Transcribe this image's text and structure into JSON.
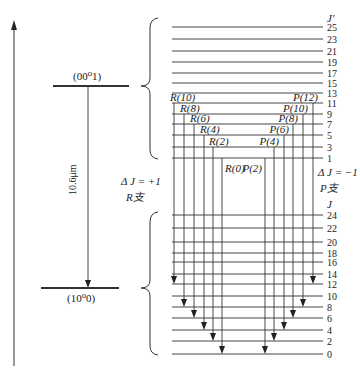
{
  "upper_state": {
    "label": "(00⁰1)",
    "y": 86,
    "header": "J′",
    "levels": [
      {
        "J": "25",
        "y": 27
      },
      {
        "J": "23",
        "y": 39
      },
      {
        "J": "21",
        "y": 51
      },
      {
        "J": "19",
        "y": 62
      },
      {
        "J": "17",
        "y": 73
      },
      {
        "J": "15",
        "y": 83
      },
      {
        "J": "13",
        "y": 93
      },
      {
        "J": "11",
        "y": 103
      },
      {
        "J": "9",
        "y": 114
      },
      {
        "J": "7",
        "y": 124
      },
      {
        "J": "5",
        "y": 135
      },
      {
        "J": "3",
        "y": 147
      },
      {
        "J": "1",
        "y": 158
      }
    ]
  },
  "lower_state": {
    "label": "(10⁰0)",
    "y": 288,
    "header": "J",
    "levels": [
      {
        "J": "24",
        "y": 215
      },
      {
        "J": "22",
        "y": 228
      },
      {
        "J": "20",
        "y": 242
      },
      {
        "J": "18",
        "y": 253
      },
      {
        "J": "16",
        "y": 262
      },
      {
        "J": "14",
        "y": 274
      },
      {
        "J": "12",
        "y": 284
      },
      {
        "J": "10",
        "y": 296
      },
      {
        "J": "8",
        "y": 307
      },
      {
        "J": "6",
        "y": 318
      },
      {
        "J": "4",
        "y": 330
      },
      {
        "J": "2",
        "y": 341
      },
      {
        "J": "0",
        "y": 354
      }
    ]
  },
  "wavelength_label": "10.6μm",
  "r_branch": {
    "delta_label": "Δ J = +1",
    "branch_label": "R支",
    "transitions": [
      {
        "label": "R(10)",
        "x": 174,
        "from_y": 103,
        "to_y": 284
      },
      {
        "label": "R(8)",
        "x": 184,
        "from_y": 114,
        "to_y": 307
      },
      {
        "label": "R(6)",
        "x": 194,
        "from_y": 124,
        "to_y": 318
      },
      {
        "label": "R(4)",
        "x": 204,
        "from_y": 135,
        "to_y": 330
      },
      {
        "label": "R(2)",
        "x": 213,
        "from_y": 147,
        "to_y": 341
      },
      {
        "label": "R(0)",
        "x": 222,
        "from_y": 158,
        "to_y": 354
      }
    ]
  },
  "p_branch": {
    "delta_label": "Δ J = −1",
    "branch_label": "P支",
    "transitions": [
      {
        "label": "P(2)",
        "x": 265,
        "from_y": 158,
        "to_y": 354
      },
      {
        "label": "P(4)",
        "x": 274,
        "from_y": 147,
        "to_y": 341
      },
      {
        "label": "P(6)",
        "x": 284,
        "from_y": 135,
        "to_y": 330
      },
      {
        "label": "P(8)",
        "x": 293,
        "from_y": 124,
        "to_y": 318
      },
      {
        "label": "P(10)",
        "x": 303,
        "from_y": 114,
        "to_y": 307
      },
      {
        "label": "P(12)",
        "x": 313,
        "from_y": 103,
        "to_y": 284
      }
    ]
  },
  "colors": {
    "line": "#333333",
    "background": "#ffffff"
  }
}
